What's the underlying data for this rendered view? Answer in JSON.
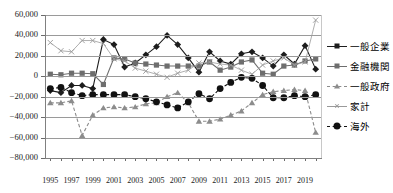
{
  "chart_title": "",
  "axes": {
    "y_ticks": [
      "60,000",
      "40,000",
      "20,000",
      "0",
      "−20,000",
      "−40,000",
      "−60,000",
      "−80,000"
    ],
    "x_ticks": [
      "1995",
      "1997",
      "1999",
      "2001",
      "2003",
      "2005",
      "2007",
      "2009",
      "2011",
      "2013",
      "2015",
      "2017",
      "2019"
    ]
  },
  "legend": {
    "items": [
      {
        "label": "一般企業",
        "marker": "diamond",
        "line": "solid",
        "color": "#1d1d1d"
      },
      {
        "label": "金融機関",
        "marker": "square",
        "line": "solid",
        "color": "#6e6e6e"
      },
      {
        "label": "一般政府",
        "marker": "triangle",
        "line": "dashed",
        "color": "#8c8c8c"
      },
      {
        "label": "家計",
        "marker": "x",
        "line": "thin",
        "color": "#9a9a9a"
      },
      {
        "label": "海外",
        "marker": "circle",
        "line": "dashed",
        "color": "#111111"
      }
    ]
  },
  "chart_data": {
    "type": "line",
    "title": "",
    "xlabel": "",
    "ylabel": "",
    "ylim": [
      -80000,
      60000
    ],
    "ytick_step": 20000,
    "grid": true,
    "legend_position": "right",
    "x": [
      1995,
      1996,
      1997,
      1998,
      1999,
      2000,
      2001,
      2002,
      2003,
      2004,
      2005,
      2006,
      2007,
      2008,
      2009,
      2010,
      2011,
      2012,
      2013,
      2014,
      2015,
      2016,
      2017,
      2018,
      2019,
      2020
    ],
    "categories": [
      "1995",
      "1996",
      "1997",
      "1998",
      "1999",
      "2000",
      "2001",
      "2002",
      "2003",
      "2004",
      "2005",
      "2006",
      "2007",
      "2008",
      "2009",
      "2010",
      "2011",
      "2012",
      "2013",
      "2014",
      "2015",
      "2016",
      "2017",
      "2018",
      "2019",
      "2020"
    ],
    "series": [
      {
        "name": "一般企業",
        "marker": "diamond",
        "line": "solid",
        "color": "#1d1d1d",
        "values": [
          -14000,
          -16000,
          -9000,
          -9000,
          -12000,
          36000,
          31000,
          9000,
          13000,
          21000,
          29000,
          40000,
          31000,
          18000,
          4000,
          24000,
          15000,
          12000,
          22000,
          24000,
          18000,
          10000,
          21000,
          12000,
          30000,
          7000
        ]
      },
      {
        "name": "金融機関",
        "marker": "square",
        "line": "solid",
        "color": "#6e6e6e",
        "values": [
          2000,
          1500,
          3000,
          3000,
          2500,
          -8000,
          18000,
          17000,
          13000,
          12000,
          11000,
          10000,
          10000,
          10000,
          10000,
          14000,
          6000,
          9000,
          14000,
          16000,
          3000,
          2000,
          10000,
          11000,
          15000,
          17000
        ]
      },
      {
        "name": "一般政府",
        "marker": "triangle",
        "line": "dashed",
        "color": "#8c8c8c",
        "values": [
          -26000,
          -26000,
          -24000,
          -58000,
          -38000,
          -31000,
          -30000,
          -31000,
          -30000,
          -27000,
          -26000,
          -20000,
          -16000,
          -26000,
          -44000,
          -44000,
          -42000,
          -38000,
          -34000,
          -26000,
          -18000,
          -15000,
          -14000,
          -13000,
          -14000,
          -55000
        ]
      },
      {
        "name": "家計",
        "marker": "x",
        "line": "thin",
        "color": "#9a9a9a",
        "values": [
          33000,
          25000,
          24000,
          35000,
          35000,
          32000,
          17000,
          15000,
          8000,
          5000,
          2000,
          -1000,
          3000,
          6000,
          13000,
          14000,
          12000,
          11000,
          6000,
          2000,
          11000,
          15000,
          18000,
          11000,
          14000,
          55000
        ]
      },
      {
        "name": "海外",
        "marker": "circle",
        "line": "dashed",
        "color": "#111111",
        "values": [
          -12000,
          -11000,
          -16000,
          -19000,
          -18000,
          -18000,
          -18000,
          -18000,
          -20000,
          -22000,
          -25000,
          -28000,
          -31000,
          -25000,
          -17000,
          -22000,
          -12000,
          -6000,
          -1000,
          -2000,
          -9000,
          -21000,
          -21000,
          -19000,
          -20000,
          -18000
        ]
      }
    ]
  }
}
